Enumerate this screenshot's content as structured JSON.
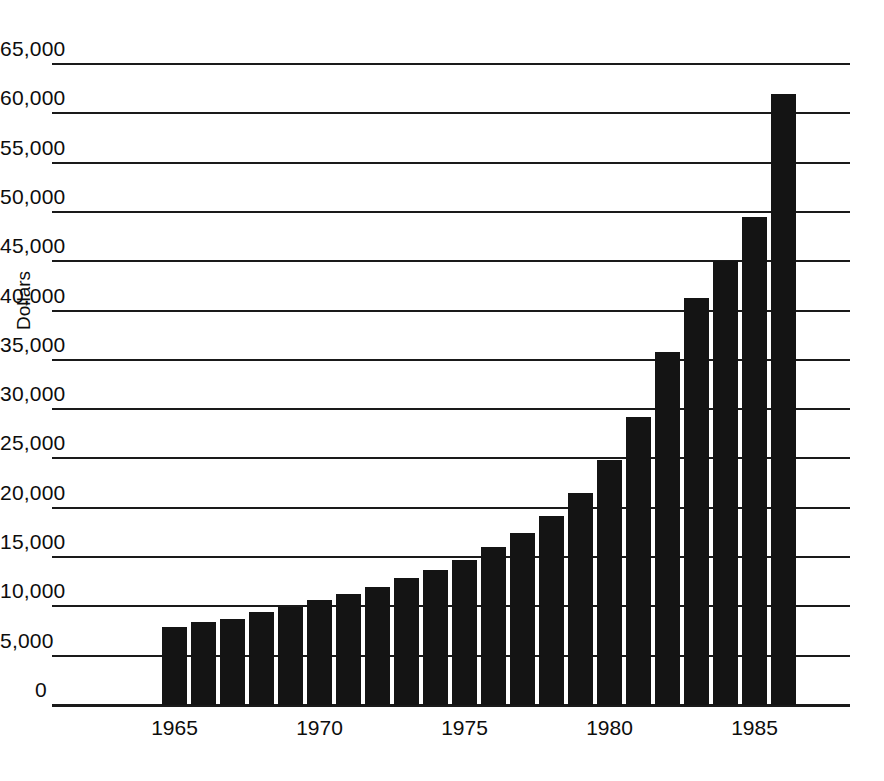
{
  "chart_data": {
    "type": "bar",
    "title": "",
    "subtitle": "",
    "xlabel": "",
    "ylabel": "Dollars",
    "ylim": [
      0,
      65000
    ],
    "ytick_step": 5000,
    "grid": true,
    "legend": null,
    "bar_color": "#141414",
    "categories": [
      "1965",
      "1966",
      "1967",
      "1968",
      "1969",
      "1970",
      "1971",
      "1972",
      "1973",
      "1974",
      "1975",
      "1976",
      "1977",
      "1978",
      "1979",
      "1980",
      "1981",
      "1982",
      "1983",
      "1984",
      "1985",
      "1986"
    ],
    "values": [
      7900,
      8400,
      8700,
      9400,
      9900,
      10600,
      11300,
      12000,
      12900,
      13700,
      14700,
      16000,
      17400,
      19200,
      21500,
      24800,
      29200,
      35800,
      41300,
      45000,
      49500,
      62000
    ],
    "ytick_labels": [
      "65,000",
      "60,000",
      "55,000",
      "50,000",
      "45,000",
      "40,000",
      "35,000",
      "30,000",
      "25,000",
      "20,000",
      "15,000",
      "10,000",
      "5,000",
      "0"
    ],
    "ytick_values": [
      65000,
      60000,
      55000,
      50000,
      45000,
      40000,
      35000,
      30000,
      25000,
      20000,
      15000,
      10000,
      5000,
      0
    ],
    "xtick_labels": [
      "1965",
      "1970",
      "1975",
      "1980",
      "1985"
    ],
    "xtick_categories": [
      "1965",
      "1970",
      "1975",
      "1980",
      "1985"
    ]
  }
}
